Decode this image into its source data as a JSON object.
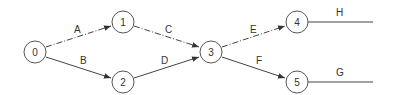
{
  "diagram": {
    "type": "activity-on-arrow network",
    "nodes": [
      {
        "id": "0",
        "label": "0",
        "x": 35,
        "y": 52
      },
      {
        "id": "1",
        "label": "1",
        "x": 123,
        "y": 22
      },
      {
        "id": "2",
        "label": "2",
        "x": 123,
        "y": 82
      },
      {
        "id": "3",
        "label": "3",
        "x": 211,
        "y": 52
      },
      {
        "id": "4",
        "label": "4",
        "x": 297,
        "y": 22
      },
      {
        "id": "5",
        "label": "5",
        "x": 297,
        "y": 82
      }
    ],
    "edges": [
      {
        "label": "A",
        "from": "0",
        "to": "1",
        "style": "dashed"
      },
      {
        "label": "B",
        "from": "0",
        "to": "2",
        "style": "solid"
      },
      {
        "label": "C",
        "from": "1",
        "to": "3",
        "style": "dashed"
      },
      {
        "label": "D",
        "from": "2",
        "to": "3",
        "style": "solid"
      },
      {
        "label": "E",
        "from": "3",
        "to": "4",
        "style": "dashed"
      },
      {
        "label": "F",
        "from": "3",
        "to": "5",
        "style": "solid"
      },
      {
        "label": "H",
        "from": "4",
        "to": null,
        "style": "solid"
      },
      {
        "label": "G",
        "from": "5",
        "to": null,
        "style": "solid"
      }
    ]
  }
}
